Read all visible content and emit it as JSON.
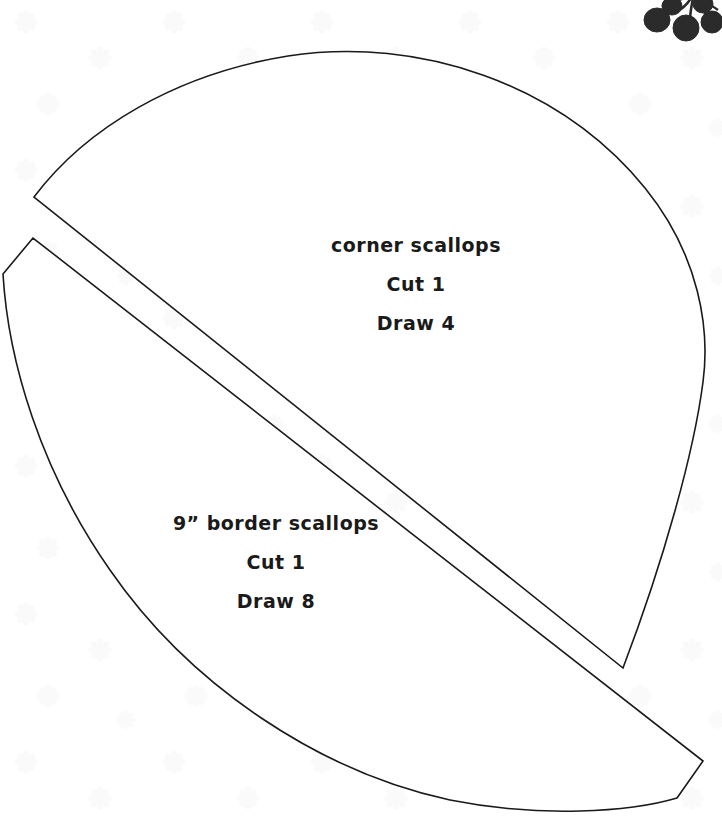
{
  "page": {
    "background_color": "#ffffff",
    "ink_color": "#1a1a1a",
    "watermark": {
      "name": "faint-floral-blossom-watermark",
      "color": "#f4f4f6",
      "tile_size_px": 148
    },
    "width_px": 722,
    "height_px": 826
  },
  "decoration": {
    "berry_cluster": {
      "name": "berry-cluster-graphic",
      "color": "#2b2b2b",
      "berry_count": 5,
      "position": "top-right"
    }
  },
  "templates": [
    {
      "id": "corner-scallops",
      "title": "corner scallops",
      "cut": "Cut 1",
      "draw": "Draw 4",
      "shape": "upper-wedge"
    },
    {
      "id": "border-scallops",
      "title": "9” border scallops",
      "cut": "Cut 1",
      "draw": "Draw 8",
      "shape": "lower-crescent"
    }
  ]
}
